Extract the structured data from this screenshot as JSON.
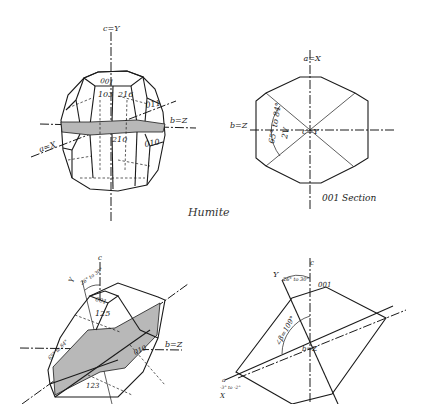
{
  "title": "Humite",
  "figures": {
    "crystal_top_left": {
      "axes": {
        "c": "c=Y",
        "b": "b=Z",
        "a": "a=X"
      },
      "faces": [
        "001",
        "103",
        "216",
        "011",
        "210",
        "010"
      ]
    },
    "section_top_right": {
      "caption": "001 Section",
      "axes": {
        "a": "a=X",
        "b": "b=Z",
        "center": "c=Y"
      },
      "angle": "65° to 84°",
      "angle_label": "2V",
      "angle_subscript": "z"
    },
    "crystal_bottom_left": {
      "axes": {
        "c": "c",
        "y": "Y",
        "b": "b=Z"
      },
      "angle": "26° to 30°",
      "faces": [
        "001",
        "125",
        "010",
        "123"
      ],
      "plane_angle": "65° to 84°",
      "plane_label": "2V"
    },
    "section_bottom_right": {
      "axes": {
        "c": "c",
        "y": "Y",
        "b": "b=Z",
        "a": "a",
        "x": "X"
      },
      "angle_top": "26° to 30°",
      "face": "001",
      "beta": "∠β=109°",
      "angle_a": "-3° to -2°"
    }
  },
  "colors": {
    "line": "#1a1a1a",
    "shade": "#b8b8b8",
    "background": "#ffffff"
  }
}
